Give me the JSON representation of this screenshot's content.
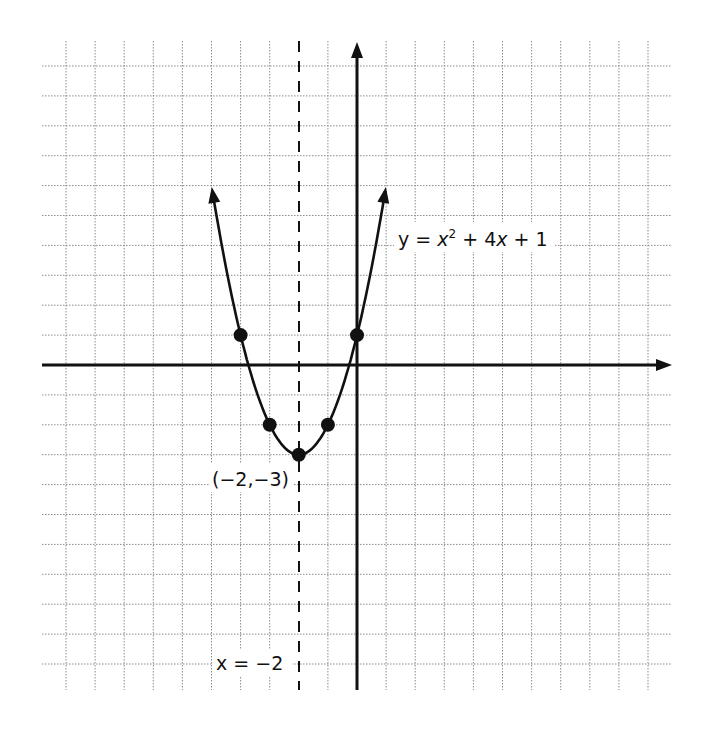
{
  "chart_data": {
    "type": "line",
    "title": "",
    "xlabel": "",
    "ylabel": "",
    "xlim": [
      -10,
      10
    ],
    "ylim": [
      -10,
      10
    ],
    "grid": true,
    "grid_style": "dotted",
    "function": "y = x^2 + 4x + 1",
    "curve_x_range": [
      -4.97,
      0.97
    ],
    "series": [
      {
        "name": "y = x² + 4x + 1",
        "type": "parabola",
        "points": [
          {
            "x": -4,
            "y": 1
          },
          {
            "x": -3,
            "y": -2
          },
          {
            "x": -2,
            "y": -3
          },
          {
            "x": -1,
            "y": -2
          },
          {
            "x": 0,
            "y": 1
          }
        ]
      }
    ],
    "axis_of_symmetry": {
      "x": -2,
      "style": "dashed"
    },
    "vertex": {
      "x": -2,
      "y": -3
    },
    "annotations": [
      {
        "text": "y = x² + 4x + 1",
        "near": "right branch, y≈4"
      },
      {
        "text": "(−2,−3)",
        "near": "vertex"
      },
      {
        "text": "x = −2",
        "near": "bottom of axis of symmetry"
      }
    ]
  },
  "labels": {
    "equation_y": "y",
    "equation_eq": " = ",
    "equation_x": "x",
    "equation_sup": "2",
    "equation_rest1": " + 4",
    "equation_x2": "x",
    "equation_rest2": " + 1",
    "vertex": "(−2,−3)",
    "symmetry": "x = −2"
  },
  "colors": {
    "ink": "#111111",
    "grid": "#8a8a8a",
    "background": "#ffffff"
  }
}
